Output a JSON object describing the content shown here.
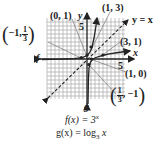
{
  "diagram": {
    "type": "function-graph",
    "grid": {
      "xmin": -10,
      "xmax": 10,
      "ymin": -10,
      "ymax": 10
    },
    "axes": {
      "x_label": "x",
      "y_label": "y",
      "x_tick": "5",
      "y_tick": "5"
    },
    "curves": [
      {
        "name": "f",
        "label": "f",
        "equation": "f(x) = 3",
        "exponent": "x",
        "style": "solid"
      },
      {
        "name": "g",
        "label": "g",
        "equation": "g(x) = log",
        "base": "3",
        "arg": "x",
        "style": "solid"
      },
      {
        "name": "identity",
        "label": "y = x",
        "style": "dashed"
      }
    ],
    "points": [
      {
        "label": "(0, 1)",
        "x": 0,
        "y": 1
      },
      {
        "label": "(1, 3)",
        "x": 1,
        "y": 3
      },
      {
        "label_prefix": "−1,",
        "frac_num": "1",
        "frac_den": "3",
        "x": -1,
        "y": 0.333
      },
      {
        "label": "(3, 1)",
        "x": 3,
        "y": 1
      },
      {
        "label": "(1, 0)",
        "x": 1,
        "y": 0
      },
      {
        "frac_num": "1",
        "frac_den": "3",
        "label_suffix": ", −1",
        "x": 0.333,
        "y": -1
      }
    ],
    "colors": {
      "ink": "#222222",
      "grid": "#9a9a9a",
      "background": "#ffffff"
    }
  }
}
